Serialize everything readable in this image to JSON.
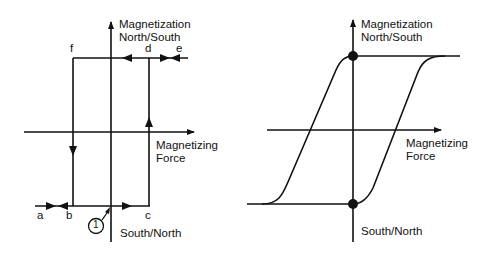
{
  "diagrams": [
    {
      "id": "square-loop",
      "axis_labels": {
        "y_top_line1": "Magnetization",
        "y_top_line2": "North/South",
        "x_right_line1": "Magnetizing",
        "x_right_line2": "Force",
        "y_bottom": "South/North"
      },
      "points": {
        "a": "a",
        "b": "b",
        "c": "c",
        "d": "d",
        "e": "e",
        "f": "f"
      },
      "callout": "1"
    },
    {
      "id": "hysteresis-loop",
      "axis_labels": {
        "y_top_line1": "Magnetization",
        "y_top_line2": "North/South",
        "x_right_line1": "Magnetizing",
        "x_right_line2": "Force",
        "y_bottom": "South/North"
      }
    }
  ],
  "colors": {
    "line": "#111111",
    "background": "#ffffff"
  }
}
